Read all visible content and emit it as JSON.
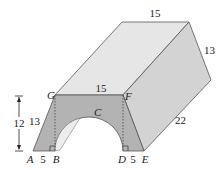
{
  "diagram": {
    "type": "3d-solid-with-arch",
    "vertices": {
      "A": "A",
      "B": "B",
      "C": "C",
      "D": "D",
      "E": "E",
      "F": "F",
      "G": "G"
    },
    "dimensions": {
      "top_back_length": "15",
      "back_slant": "13",
      "front_top_GF": "15",
      "front_slant_AG": "13",
      "height": "12",
      "AB": "5",
      "DE": "5",
      "depth": "22"
    },
    "colors": {
      "front_face": "#b3b3b3",
      "top_face": "#e6e6e6",
      "side_face": "#d3d3d3",
      "tunnel": "#ececec",
      "edge": "#555555"
    }
  }
}
